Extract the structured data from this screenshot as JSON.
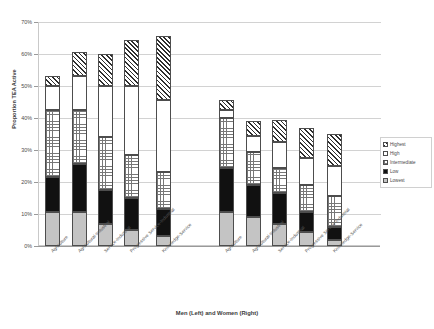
{
  "chart_data": {
    "type": "bar",
    "subtype": "stacked-column",
    "title": "",
    "xlabel": "Men (Left) and Women (Right)",
    "ylabel": "Proportion TEA Active",
    "ylim": [
      0,
      0.7
    ],
    "ytick_labels": [
      "0%",
      "10%",
      "20%",
      "30%",
      "40%",
      "50%",
      "60%",
      "70%"
    ],
    "ytick_values": [
      0,
      10,
      20,
      30,
      40,
      50,
      60,
      70
    ],
    "grid": true,
    "legend_position": "right",
    "groups": [
      "Men",
      "Women"
    ],
    "categories": [
      "Agriculture",
      "Agricultural-Industrial",
      "Service-Industrial",
      "Progressive Service-Industrial",
      "Knowledge-Service"
    ],
    "series": [
      {
        "name": "Lowest",
        "fill": "solid-light-gray",
        "color": "#c4c4c4",
        "men": [
          10.5,
          10.5,
          7.0,
          5.0,
          3.0
        ],
        "women": [
          10.5,
          9.0,
          7.0,
          4.5,
          2.0
        ]
      },
      {
        "name": "Low",
        "fill": "solid-black",
        "color": "#111111",
        "men": [
          11.0,
          15.0,
          10.5,
          10.0,
          8.5
        ],
        "women": [
          14.0,
          10.0,
          9.5,
          6.0,
          4.0
        ]
      },
      {
        "name": "Intermediate",
        "fill": "checker",
        "color": "#ffffff",
        "men": [
          21.0,
          17.0,
          16.5,
          13.5,
          11.5
        ],
        "women": [
          15.5,
          10.5,
          8.0,
          8.5,
          9.5
        ]
      },
      {
        "name": "High",
        "fill": "white",
        "color": "#ffffff",
        "men": [
          7.5,
          10.5,
          16.0,
          21.5,
          22.5
        ],
        "women": [
          2.5,
          5.0,
          8.0,
          8.5,
          9.5
        ]
      },
      {
        "name": "Highest",
        "fill": "diagonal-hatch",
        "color": "#2e2e2e",
        "men": [
          3.0,
          7.5,
          10.0,
          14.5,
          20.0
        ],
        "women": [
          3.0,
          4.5,
          7.0,
          9.5,
          10.0
        ]
      }
    ],
    "totals": {
      "men": [
        53.0,
        60.5,
        60.0,
        64.5,
        65.5
      ],
      "women": [
        45.5,
        39.0,
        39.5,
        36.0,
        35.0
      ]
    }
  },
  "legend": {
    "items": [
      {
        "label": "Highest"
      },
      {
        "label": "High"
      },
      {
        "label": "Intermediate"
      },
      {
        "label": "Low"
      },
      {
        "label": "Lowest"
      }
    ]
  }
}
